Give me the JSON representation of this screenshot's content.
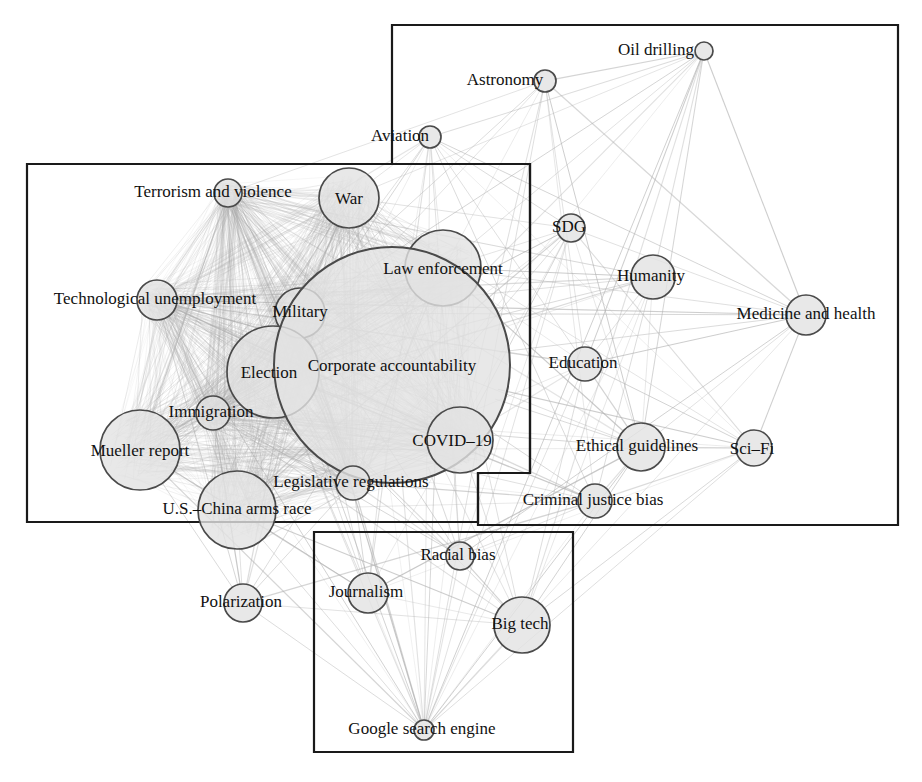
{
  "figure": {
    "kind": "network-graph",
    "background": "#ffffff",
    "node_fill": "#e2e2e2",
    "node_stroke": "#4a4a4a",
    "edge_color": "#b0b0b0",
    "box_stroke": "#1a1a1a",
    "label_color": "#111111"
  },
  "chart_data": {
    "type": "scatter",
    "title": "",
    "xlabel": "",
    "ylabel": "",
    "legend": [],
    "nodes": [
      {
        "id": "oil_drilling",
        "label": "Oil drilling",
        "x": 704,
        "y": 51,
        "r": 9,
        "label_dx": -48,
        "label_dy": -2,
        "fs": 17,
        "cluster": "right"
      },
      {
        "id": "astronomy",
        "label": "Astronomy",
        "x": 545,
        "y": 81,
        "r": 11,
        "label_dx": -40,
        "label_dy": -2,
        "fs": 17,
        "cluster": "right"
      },
      {
        "id": "aviation",
        "label": "Aviation",
        "x": 430,
        "y": 137,
        "r": 11,
        "label_dx": -30,
        "label_dy": -2,
        "fs": 17,
        "cluster": "right"
      },
      {
        "id": "terrorism_and_violence",
        "label": "Terrorism and violence",
        "x": 228,
        "y": 193,
        "r": 14,
        "label_dx": -15,
        "label_dy": -2,
        "fs": 17,
        "cluster": "left"
      },
      {
        "id": "war",
        "label": "War",
        "x": 349,
        "y": 198,
        "r": 30,
        "label_dx": 0,
        "label_dy": 0,
        "fs": 17,
        "cluster": "left"
      },
      {
        "id": "sdg",
        "label": "SDG",
        "x": 571,
        "y": 228,
        "r": 14,
        "label_dx": -2,
        "label_dy": -2,
        "fs": 17,
        "cluster": "right"
      },
      {
        "id": "law_enforcement",
        "label": "Law enforcement",
        "x": 443,
        "y": 268,
        "r": 38,
        "label_dx": 0,
        "label_dy": 0,
        "fs": 17,
        "cluster": "left"
      },
      {
        "id": "humanity",
        "label": "Humanity",
        "x": 653,
        "y": 277,
        "r": 22,
        "label_dx": -2,
        "label_dy": -2,
        "fs": 17,
        "cluster": "right"
      },
      {
        "id": "technological_unemployment",
        "label": "Technological unemployment",
        "x": 157,
        "y": 300,
        "r": 20,
        "label_dx": -2,
        "label_dy": -2,
        "fs": 17,
        "cluster": "left"
      },
      {
        "id": "military",
        "label": "Military",
        "x": 300,
        "y": 313,
        "r": 25,
        "label_dx": 0,
        "label_dy": -2,
        "fs": 17,
        "cluster": "left"
      },
      {
        "id": "medicine_and_health",
        "label": "Medicine and health",
        "x": 806,
        "y": 315,
        "r": 20,
        "label_dx": 0,
        "label_dy": -2,
        "fs": 17,
        "cluster": "right"
      },
      {
        "id": "election",
        "label": "Election",
        "x": 273,
        "y": 372,
        "r": 46,
        "label_dx": -4,
        "label_dy": 0,
        "fs": 17,
        "cluster": "left"
      },
      {
        "id": "corporate_accountability",
        "label": "Corporate accountability",
        "x": 392,
        "y": 365,
        "r": 118,
        "label_dx": 0,
        "label_dy": 0,
        "fs": 17,
        "cluster": "left"
      },
      {
        "id": "education",
        "label": "Education",
        "x": 585,
        "y": 364,
        "r": 17,
        "label_dx": -2,
        "label_dy": -2,
        "fs": 17,
        "cluster": "right"
      },
      {
        "id": "immigration",
        "label": "Immigration",
        "x": 213,
        "y": 413,
        "r": 17,
        "label_dx": -2,
        "label_dy": -2,
        "fs": 17,
        "cluster": "left"
      },
      {
        "id": "covid_19",
        "label": "COVID–19",
        "x": 460,
        "y": 440,
        "r": 33,
        "label_dx": -8,
        "label_dy": 0,
        "fs": 17,
        "cluster": "left"
      },
      {
        "id": "ethical_guidelines",
        "label": "Ethical guidelines",
        "x": 641,
        "y": 447,
        "r": 24,
        "label_dx": -4,
        "label_dy": -2,
        "fs": 17,
        "cluster": "right"
      },
      {
        "id": "sci_fi",
        "label": "Sci–Fi",
        "x": 754,
        "y": 448,
        "r": 18,
        "label_dx": -2,
        "label_dy": 0,
        "fs": 17,
        "cluster": "right"
      },
      {
        "id": "mueller_report",
        "label": "Mueller report",
        "x": 140,
        "y": 450,
        "r": 40,
        "label_dx": 0,
        "label_dy": 0,
        "fs": 17,
        "cluster": "left"
      },
      {
        "id": "legislative_regulations",
        "label": "Legislative regulations",
        "x": 353,
        "y": 483,
        "r": 17,
        "label_dx": -2,
        "label_dy": -2,
        "fs": 17,
        "cluster": "left"
      },
      {
        "id": "criminal_justice_bias",
        "label": "Criminal justice bias",
        "x": 595,
        "y": 501,
        "r": 17,
        "label_dx": -2,
        "label_dy": -2,
        "fs": 17,
        "cluster": "right"
      },
      {
        "id": "us_china_arms_race",
        "label": "U.S.–China arms race",
        "x": 237,
        "y": 510,
        "r": 39,
        "label_dx": 0,
        "label_dy": -2,
        "fs": 17,
        "cluster": "left"
      },
      {
        "id": "racial_bias",
        "label": "Racial bias",
        "x": 460,
        "y": 556,
        "r": 14,
        "label_dx": -2,
        "label_dy": -2,
        "fs": 17,
        "cluster": "bottom"
      },
      {
        "id": "journalism",
        "label": "Journalism",
        "x": 368,
        "y": 593,
        "r": 20,
        "label_dx": -2,
        "label_dy": -2,
        "fs": 17,
        "cluster": "bottom"
      },
      {
        "id": "polarization",
        "label": "Polarization",
        "x": 243,
        "y": 603,
        "r": 19,
        "label_dx": -2,
        "label_dy": -2,
        "fs": 17,
        "cluster": "left"
      },
      {
        "id": "big_tech",
        "label": "Big tech",
        "x": 522,
        "y": 625,
        "r": 28,
        "label_dx": -2,
        "label_dy": -2,
        "fs": 17,
        "cluster": "bottom"
      },
      {
        "id": "google_search_engine",
        "label": "Google search engine",
        "x": 424,
        "y": 730,
        "r": 10,
        "label_dx": -2,
        "label_dy": -2,
        "fs": 17,
        "cluster": "bottom"
      }
    ],
    "clusters": [
      {
        "id": "cluster-left",
        "name": "left-cluster-box",
        "points": "27,164 530,164 530,473 478,473 478,522 27,522"
      },
      {
        "id": "cluster-right",
        "name": "right-cluster-box",
        "points": "392,25 898,25 898,525 478,525 478,473 530,473 530,164 392,164"
      },
      {
        "id": "cluster-bottom",
        "name": "bottom-cluster-box",
        "points": "314,532 573,532 573,752 314,752"
      }
    ],
    "edge_density": "high",
    "edges_note": "dense all-pairs co-occurrence links drawn in light gray"
  }
}
